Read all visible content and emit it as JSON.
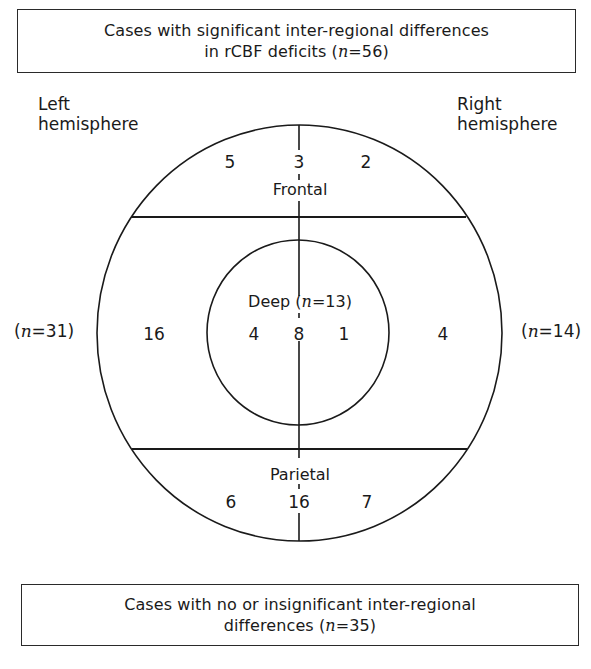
{
  "top_box": {
    "line1": "Cases with significant inter-regional differences",
    "line2_prefix": "in rCBF deficits (",
    "n_symbol": "n",
    "line2_suffix": "=56)"
  },
  "bottom_box": {
    "line1": "Cases with no or insignificant inter-regional",
    "line2_prefix": "differences (",
    "n_symbol": "n",
    "line2_suffix": "=35)"
  },
  "hemispheres": {
    "left": {
      "line1": "Left",
      "line2": "hemisphere",
      "count_prefix": "(",
      "n_symbol": "n",
      "count_suffix": "=31)"
    },
    "right": {
      "line1": "Right",
      "line2": "hemisphere",
      "count_prefix": "(",
      "n_symbol": "n",
      "count_suffix": "=14)"
    }
  },
  "regions": {
    "frontal": {
      "label": "Frontal",
      "left": "5",
      "midline": "3",
      "right": "2"
    },
    "temporal_lateral": {
      "left": "16",
      "right": "4"
    },
    "deep": {
      "label_prefix": "Deep (",
      "n_symbol": "n",
      "label_suffix": "=13)",
      "left": "4",
      "midline": "8",
      "right": "1"
    },
    "parietal": {
      "label": "Parietal",
      "left": "6",
      "midline": "16",
      "right": "7"
    }
  },
  "colors": {
    "line": "#1a1a1a",
    "background": "#ffffff"
  }
}
